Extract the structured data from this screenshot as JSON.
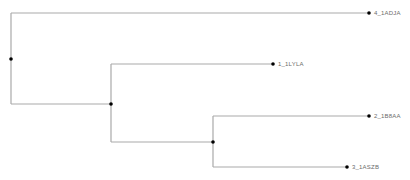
{
  "diagram": {
    "type": "phylogenetic-tree",
    "colors": {
      "branch": "#a9a9a9",
      "node": "#000000",
      "label": "#6b6b6b"
    },
    "internal_nodes": [
      {
        "id": "root",
        "x": 11,
        "y": 59
      },
      {
        "id": "n1",
        "x": 111,
        "y": 104
      },
      {
        "id": "n2",
        "x": 213,
        "y": 142
      }
    ],
    "leaves": [
      {
        "id": "leaf-4",
        "label": "4_1ADJA",
        "x": 369,
        "y": 13
      },
      {
        "id": "leaf-1",
        "label": "1_1LYLA",
        "x": 273,
        "y": 64
      },
      {
        "id": "leaf-2",
        "label": "2_1B8AA",
        "x": 369,
        "y": 116
      },
      {
        "id": "leaf-3",
        "label": "3_1ASZB",
        "x": 347,
        "y": 167
      }
    ],
    "structure": "(4_1ADJA,(1_1LYLA,(2_1B8AA,3_1ASZB)))"
  }
}
